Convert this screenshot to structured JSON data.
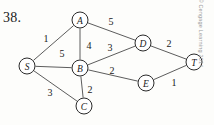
{
  "page": {
    "problem_number": "38.",
    "top_bleed_text": "· · · · · · · · · · ·",
    "copyright": "© Cengage Learning 2014"
  },
  "chart_data": {
    "type": "diagram",
    "title": "",
    "subtitle": "",
    "diagram_kind": "weighted-undirected-graph",
    "nodes": [
      {
        "id": "S",
        "label": "S",
        "x": 27,
        "y": 66,
        "r": 8
      },
      {
        "id": "A",
        "label": "A",
        "x": 80,
        "y": 20,
        "r": 8
      },
      {
        "id": "B",
        "label": "B",
        "x": 80,
        "y": 68,
        "r": 8
      },
      {
        "id": "C",
        "label": "C",
        "x": 84,
        "y": 106,
        "r": 8
      },
      {
        "id": "D",
        "label": "D",
        "x": 143,
        "y": 43,
        "r": 8
      },
      {
        "id": "E",
        "label": "E",
        "x": 146,
        "y": 83,
        "r": 8
      },
      {
        "id": "T",
        "label": "T",
        "x": 194,
        "y": 62,
        "r": 8
      }
    ],
    "edges": [
      {
        "from": "S",
        "to": "A",
        "weight": "1",
        "lx": 46,
        "ly": 38
      },
      {
        "from": "S",
        "to": "B",
        "weight": "5",
        "lx": 62,
        "ly": 53
      },
      {
        "from": "S",
        "to": "C",
        "weight": "3",
        "lx": 50,
        "ly": 92
      },
      {
        "from": "A",
        "to": "B",
        "weight": "4",
        "lx": 89,
        "ly": 45
      },
      {
        "from": "A",
        "to": "D",
        "weight": "5",
        "lx": 111,
        "ly": 21
      },
      {
        "from": "B",
        "to": "C",
        "weight": "2",
        "lx": 90,
        "ly": 89
      },
      {
        "from": "B",
        "to": "D",
        "weight": "3",
        "lx": 110,
        "ly": 47
      },
      {
        "from": "B",
        "to": "E",
        "weight": "2",
        "lx": 112,
        "ly": 70
      },
      {
        "from": "D",
        "to": "T",
        "weight": "2",
        "lx": 169,
        "ly": 43
      },
      {
        "from": "E",
        "to": "T",
        "weight": "1",
        "lx": 174,
        "ly": 82
      }
    ],
    "node_labels": [
      "S",
      "A",
      "B",
      "C",
      "D",
      "E",
      "T"
    ],
    "weights": [
      "1",
      "5",
      "3",
      "4",
      "5",
      "2",
      "3",
      "2",
      "2",
      "1"
    ],
    "xlabel": "",
    "ylabel": ""
  }
}
